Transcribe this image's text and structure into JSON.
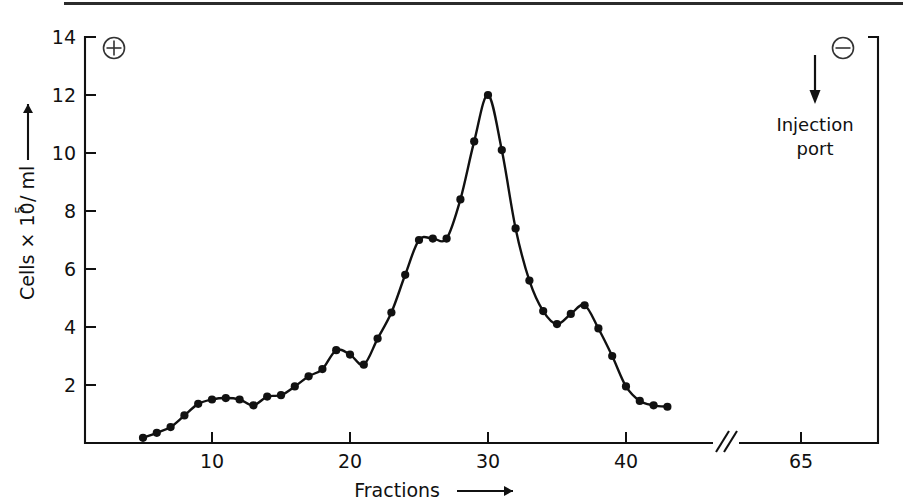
{
  "figure": {
    "top_rule": "horizontal-rule",
    "background_color": "#ffffff",
    "ink_color": "#111111"
  },
  "annotations": {
    "anode_symbol": "⊕",
    "anode_name": "plus-circle",
    "cathode_symbol": "⊖",
    "cathode_name": "minus-circle",
    "injection_port_line1": "Injection",
    "injection_port_line2": "port",
    "injection_arrow": "↓",
    "axis_break_symbol": "//"
  },
  "chart_data": {
    "type": "line",
    "title": "",
    "xlabel": "Fractions",
    "xlabel_arrow": "⟶",
    "ylabel": "Cells × 10",
    "ylabel_exponent": "5",
    "ylabel_unit": "/ ml",
    "ylabel_arrow": "⟶",
    "grid": false,
    "legend": "none",
    "xlim": [
      0,
      46
    ],
    "ylim": [
      0,
      14
    ],
    "xticks": [
      10,
      20,
      30,
      40
    ],
    "xtick_labels": [
      "10",
      "20",
      "30",
      "40"
    ],
    "break_tick": 65,
    "break_tick_label": "65",
    "yticks": [
      2,
      4,
      6,
      8,
      10,
      12,
      14
    ],
    "ytick_labels": [
      "2",
      "4",
      "6",
      "8",
      "10",
      "12",
      "14"
    ],
    "marker": "filled-circle",
    "x": [
      5,
      6,
      7,
      8,
      9,
      10,
      11,
      12,
      13,
      14,
      15,
      16,
      17,
      18,
      19,
      20,
      21,
      22,
      23,
      24,
      25,
      26,
      27,
      28,
      29,
      30,
      31,
      32,
      33,
      34,
      35,
      36,
      37,
      38,
      39,
      40,
      41,
      42,
      43
    ],
    "y": [
      0.18,
      0.35,
      0.55,
      0.95,
      1.35,
      1.5,
      1.55,
      1.5,
      1.3,
      1.6,
      1.65,
      1.95,
      2.3,
      2.55,
      3.2,
      3.05,
      2.7,
      3.6,
      4.5,
      5.8,
      7.0,
      7.05,
      7.05,
      8.4,
      10.4,
      12.0,
      10.1,
      7.4,
      5.6,
      4.55,
      4.1,
      4.45,
      4.75,
      3.95,
      3.0,
      1.95,
      1.45,
      1.3,
      1.25
    ]
  }
}
